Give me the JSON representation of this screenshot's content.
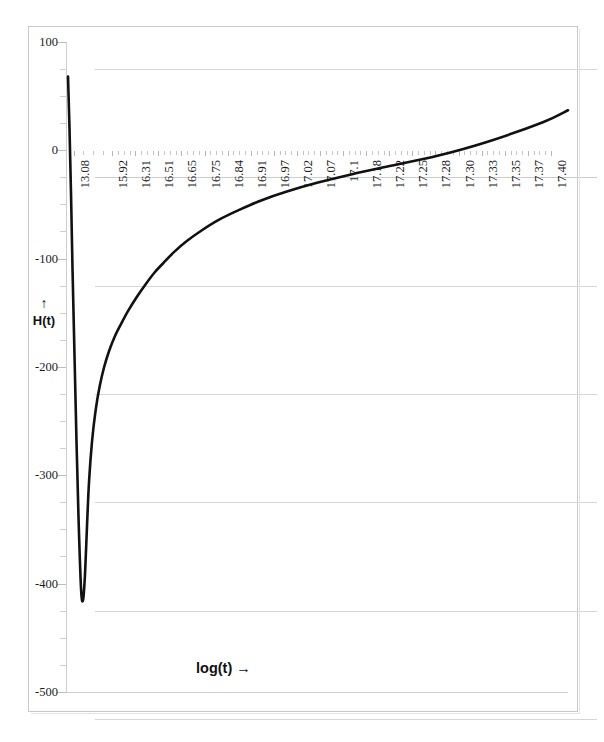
{
  "chart_data": {
    "type": "line",
    "title": "",
    "xlabel": "log(t)",
    "xlabel_display": "log(t)  →",
    "ylabel": "H(t)",
    "ylabel_arrow": "↑",
    "xlim": [
      0,
      20
    ],
    "ylim": [
      -500,
      100
    ],
    "ytick_step": 100,
    "grid": true,
    "legend": false,
    "yticks": [
      100,
      0,
      -100,
      -200,
      -300,
      -400,
      -500
    ],
    "ytick_labels": [
      "100",
      "0",
      "-100",
      "-200",
      "-300",
      "-400",
      "-500"
    ],
    "xtick_labels": [
      "13.08",
      "15.92",
      "16.31",
      "16.51",
      "16.65",
      "16.75",
      "16.84",
      "16.91",
      "16.97",
      "17.02",
      "17.07",
      "17.1",
      "17.18",
      "17.22",
      "17.25",
      "17.28",
      "17.30",
      "17.33",
      "17.35",
      "17.37",
      "17.40"
    ],
    "xtick_positions_pct": [
      1.5,
      9.2,
      13.8,
      18.4,
      23.0,
      27.6,
      32.2,
      36.8,
      41.4,
      46.0,
      50.6,
      55.2,
      59.8,
      64.4,
      69.0,
      73.6,
      78.2,
      82.8,
      87.4,
      92.0,
      96.6
    ],
    "series": [
      {
        "name": "H(t)",
        "color": "#111111",
        "x": [
          0.4,
          0.7,
          1.0,
          1.3,
          1.7,
          2.1,
          2.5,
          3.0,
          3.4,
          3.8,
          4.2,
          4.6,
          5.2,
          5.9,
          6.7,
          7.6,
          8.6,
          9.7,
          11.0,
          12.4,
          14.0,
          15.8,
          17.6,
          19.4,
          21.5,
          24.0,
          27.0,
          30.5,
          34.5,
          39.0,
          44.0,
          50.0,
          57.0,
          65.0,
          74.0,
          84.0,
          95.0,
          100.0
        ],
        "y": [
          68,
          20,
          -40,
          -110,
          -190,
          -270,
          -340,
          -405,
          -415,
          -390,
          -345,
          -305,
          -268,
          -240,
          -218,
          -200,
          -185,
          -172,
          -160,
          -148,
          -136,
          -124,
          -113,
          -104,
          -94,
          -84,
          -74,
          -64,
          -55,
          -46,
          -38,
          -30,
          -22,
          -14,
          -5,
          8,
          26,
          37
        ],
        "y_min": -415,
        "y_start": 68,
        "y_end": 37
      }
    ],
    "annotations": {
      "shape": "singularity dip near left edge then monotone asymptotic rise toward zero and above"
    }
  },
  "figure": {
    "frame_color": "#c9c9c9",
    "background": "#ffffff",
    "grid_color": "#d6d6d6",
    "axis_color": "#cfcfcf",
    "curve_color": "#111111"
  }
}
